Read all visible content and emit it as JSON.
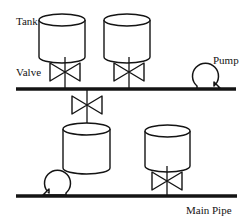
{
  "diagram": {
    "canvas": {
      "width": 250,
      "height": 224,
      "background": "#ffffff"
    },
    "stroke_color": "#141414",
    "pipe_color": "#141414",
    "labels": {
      "tank": "Tank",
      "valve": "Valve",
      "pump": "Pump",
      "main_pipe": "Main Pipe"
    },
    "pipes": [
      {
        "name": "upper-pipe",
        "x1": 16,
        "y1": 89,
        "x2": 236,
        "y2": 89,
        "thickness": 3.2
      },
      {
        "name": "main-pipe",
        "x1": 16,
        "y1": 196,
        "x2": 237,
        "y2": 196,
        "thickness": 3.2
      }
    ],
    "tanks": [
      {
        "name": "tank-top-left",
        "cx": 62,
        "top": 14,
        "width": 46,
        "height": 43,
        "ellipse_ry": 6
      },
      {
        "name": "tank-top-right",
        "cx": 127,
        "top": 14,
        "width": 46,
        "height": 43,
        "ellipse_ry": 6
      },
      {
        "name": "tank-middle",
        "cx": 86,
        "top": 123,
        "width": 47,
        "height": 45,
        "ellipse_ry": 6
      },
      {
        "name": "tank-bottom-right",
        "cx": 167,
        "top": 125,
        "width": 45,
        "height": 41,
        "ellipse_ry": 6
      }
    ],
    "valves": [
      {
        "name": "valve-top-left",
        "cx": 65,
        "cy": 72,
        "half_width": 15,
        "half_height": 9
      },
      {
        "name": "valve-top-right",
        "cx": 129,
        "cy": 72,
        "half_width": 15,
        "half_height": 9
      },
      {
        "name": "valve-middle",
        "cx": 87,
        "cy": 105,
        "half_width": 15,
        "half_height": 9
      },
      {
        "name": "valve-bottom-right",
        "cx": 167,
        "cy": 181,
        "half_width": 15,
        "half_height": 9
      }
    ],
    "pumps": [
      {
        "name": "pump-upper-right",
        "cx": 207,
        "cy": 76,
        "r": 13,
        "nozzle": "right"
      },
      {
        "name": "pump-lower-left",
        "cx": 57,
        "cy": 183,
        "r": 13,
        "nozzle": "left"
      }
    ],
    "stems": [
      {
        "name": "stem-tank-top-left",
        "x": 65,
        "y1": 57,
        "y2": 89
      },
      {
        "name": "stem-tank-top-right",
        "x": 129,
        "y1": 57,
        "y2": 89
      },
      {
        "name": "stem-middle-valve",
        "x": 87,
        "y1": 89,
        "y2": 124
      },
      {
        "name": "stem-bottom-right",
        "x": 167,
        "y1": 166,
        "y2": 196
      }
    ],
    "label_positions": {
      "tank": {
        "x": 16,
        "y": 25
      },
      "valve": {
        "x": 16,
        "y": 76
      },
      "pump": {
        "x": 213,
        "y": 64
      },
      "main_pipe": {
        "x": 186,
        "y": 213
      }
    }
  }
}
